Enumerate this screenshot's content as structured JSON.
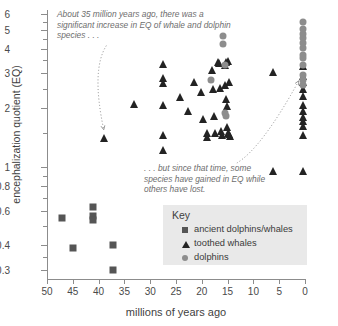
{
  "chart_data": {
    "type": "scatter",
    "title": "",
    "xlabel": "millions of years ago",
    "ylabel": "encephalization quotient (EQ)",
    "x_ticks": [
      50,
      45,
      40,
      35,
      30,
      25,
      20,
      15,
      10,
      5,
      0
    ],
    "xlim": [
      50,
      0
    ],
    "x_axis_reversed": true,
    "y_scale": "log",
    "y_ticks": [
      0.3,
      0.4,
      0.6,
      0.8,
      1,
      2,
      3,
      4,
      5,
      6
    ],
    "y_minor_ticks": [
      0.35,
      0.5,
      0.7,
      0.9,
      1.5,
      2.5,
      3.5,
      4.5,
      5.5
    ],
    "ylim": [
      0.27,
      6.3
    ],
    "grid": false,
    "legend_position": "lower-right",
    "series": [
      {
        "name": "ancient dolphins/whales",
        "marker": "square",
        "color": "#555555",
        "points": [
          [
            47.0,
            0.55
          ],
          [
            45.0,
            0.39
          ],
          [
            41.0,
            0.625
          ],
          [
            41.0,
            0.565
          ],
          [
            41.0,
            0.54
          ],
          [
            37.2,
            0.4
          ],
          [
            37.2,
            0.3
          ]
        ]
      },
      {
        "name": "toothed whales",
        "marker": "triangle",
        "color": "#232323",
        "points": [
          [
            39.0,
            1.4
          ],
          [
            33.2,
            2.1
          ],
          [
            27.6,
            3.35
          ],
          [
            27.6,
            2.85
          ],
          [
            27.6,
            2.68
          ],
          [
            27.6,
            2.08
          ],
          [
            27.6,
            1.45
          ],
          [
            27.6,
            1.22
          ],
          [
            24.2,
            2.28
          ],
          [
            22.6,
            1.92
          ],
          [
            21.5,
            2.72
          ],
          [
            20.2,
            2.4
          ],
          [
            19.8,
            1.75
          ],
          [
            19.0,
            1.5
          ],
          [
            18.9,
            1.42
          ],
          [
            18.0,
            3.12
          ],
          [
            17.9,
            2.5
          ],
          [
            17.6,
            1.82
          ],
          [
            17.4,
            1.5
          ],
          [
            16.8,
            3.42
          ],
          [
            16.6,
            3.38
          ],
          [
            16.4,
            2.52
          ],
          [
            16.2,
            1.52
          ],
          [
            16.0,
            1.45
          ],
          [
            15.6,
            3.3
          ],
          [
            15.5,
            2.62
          ],
          [
            15.4,
            3.42
          ],
          [
            15.3,
            2.22
          ],
          [
            15.2,
            2.05
          ],
          [
            15.1,
            1.6
          ],
          [
            15.0,
            1.5
          ],
          [
            14.9,
            3.48
          ],
          [
            14.8,
            2.7
          ],
          [
            14.7,
            1.48
          ],
          [
            14.6,
            1.44
          ],
          [
            6.2,
            3.05
          ],
          [
            6.2,
            0.96
          ],
          [
            0.4,
            3.28
          ],
          [
            0.3,
            2.9
          ],
          [
            0.3,
            2.72
          ],
          [
            0.3,
            2.5
          ],
          [
            0.3,
            2.3
          ],
          [
            0.3,
            2.08
          ],
          [
            0.3,
            1.92
          ],
          [
            0.3,
            1.8
          ],
          [
            0.3,
            1.72
          ],
          [
            0.3,
            1.62
          ],
          [
            0.3,
            1.45
          ],
          [
            0.3,
            0.96
          ],
          [
            0.3,
            0.6
          ]
        ]
      },
      {
        "name": "dolphins",
        "marker": "circle",
        "color": "#8d8d8d",
        "points": [
          [
            15.8,
            4.65
          ],
          [
            15.8,
            4.25
          ],
          [
            15.6,
            3.3
          ],
          [
            15.6,
            1.88
          ],
          [
            15.3,
            1.82
          ],
          [
            18.2,
            2.78
          ],
          [
            0.3,
            5.45
          ],
          [
            0.3,
            5.05
          ],
          [
            0.3,
            4.78
          ],
          [
            0.3,
            4.52
          ],
          [
            0.3,
            4.3
          ],
          [
            0.3,
            4.05
          ],
          [
            0.3,
            3.7
          ],
          [
            0.3,
            3.58
          ],
          [
            0.3,
            3.32
          ],
          [
            0.3,
            2.95
          ],
          [
            0.3,
            2.78
          ],
          [
            0.3,
            2.62
          ]
        ]
      }
    ],
    "annotations": [
      {
        "name": "annotation-increase",
        "text": "About 35 million years ago, there was a significant increase in EQ of whale and dolphin species . . .",
        "arrow_from": [
          38.5,
          4.15
        ],
        "arrow_to": [
          39.0,
          1.55
        ]
      },
      {
        "name": "annotation-gain-loss",
        "text": ". . . but since that time, some species have gained in EQ while others have lost.",
        "arrow_from": [
          13.2,
          1.05
        ],
        "arrow_to": [
          1.2,
          2.75
        ]
      }
    ]
  },
  "legend": {
    "title": "Key",
    "items": [
      {
        "label": "ancient dolphins/whales",
        "marker": "square-marker-icon"
      },
      {
        "label": "toothed whales",
        "marker": "triangle-marker-icon"
      },
      {
        "label": "dolphins",
        "marker": "circle-marker-icon"
      }
    ]
  },
  "colors": {
    "ancient": "#555555",
    "toothed": "#232323",
    "dolphins": "#8d8d8d",
    "axis": "#8c8c8c",
    "annotation_text": "#6d6d6d",
    "legend_background": "#e9e9e9"
  }
}
